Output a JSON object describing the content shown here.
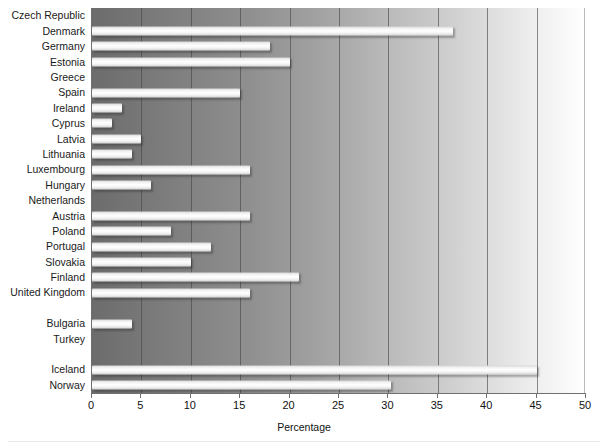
{
  "chart_data": {
    "type": "bar",
    "orientation": "horizontal",
    "title": "",
    "xlabel": "Percentage",
    "ylabel": "",
    "xlim": [
      0,
      50
    ],
    "xticks": [
      0,
      5,
      10,
      15,
      20,
      25,
      30,
      35,
      40,
      45,
      50
    ],
    "grid": true,
    "legend": null,
    "categories": [
      "Czech Republic",
      "Denmark",
      "Germany",
      "Estonia",
      "Greece",
      "Spain",
      "Ireland",
      "Cyprus",
      "Latvia",
      "Lithuania",
      "Luxembourg",
      "Hungary",
      "Netherlands",
      "Austria",
      "Poland",
      "Portugal",
      "Slovakia",
      "Finland",
      "United Kingdom",
      "",
      "Bulgaria",
      "Turkey",
      "",
      "Iceland",
      "Norway"
    ],
    "values": [
      0,
      36.5,
      18,
      20,
      0,
      15,
      3,
      2,
      5,
      4,
      16,
      6,
      0,
      16,
      8,
      12,
      10,
      21,
      16,
      null,
      4,
      0,
      null,
      45,
      30.3
    ]
  },
  "axis": {
    "tick_labels": [
      "0",
      "5",
      "10",
      "15",
      "20",
      "25",
      "30",
      "35",
      "40",
      "45",
      "50"
    ],
    "x_title": "Percentage"
  },
  "colors": {
    "bar_fill": "#ffffff",
    "plot_gradient_start": "#6c6c6c",
    "plot_gradient_end": "#ffffff",
    "gridline": "#464646",
    "text": "#1a1a1a"
  }
}
